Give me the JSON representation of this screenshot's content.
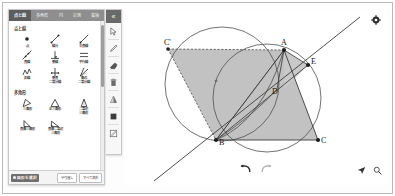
{
  "app": {
    "title": "幾何作図ツール"
  },
  "tool_panel": {
    "tabs": [
      {
        "label": "点と線",
        "active": true
      },
      {
        "label": "多角形",
        "active": false
      },
      {
        "label": "円",
        "active": false
      },
      {
        "label": "計測",
        "active": false
      },
      {
        "label": "変換",
        "active": false
      }
    ],
    "groups": [
      {
        "title": "点と線",
        "tools": [
          {
            "label": "点",
            "icon": "point-icon"
          },
          {
            "label": "線分",
            "icon": "segment-icon"
          },
          {
            "label": "半直線",
            "icon": "ray-icon"
          },
          {
            "label": "直線",
            "icon": "line-icon"
          },
          {
            "label": "垂線",
            "icon": "perpendicular-icon"
          },
          {
            "label": "平行線",
            "icon": "parallel-icon"
          },
          {
            "label": "折線",
            "icon": "polyline-icon"
          },
          {
            "label": "垂直\n二等分線",
            "icon": "perp-bisector-icon"
          },
          {
            "label": "角の\n二等分線",
            "icon": "angle-bisector-icon"
          }
        ]
      },
      {
        "title": "多角形",
        "tools": [
          {
            "label": "三角形",
            "icon": "triangle-icon"
          },
          {
            "label": "正三角形",
            "icon": "equilateral-triangle-icon"
          },
          {
            "label": "二等辺\n三角形",
            "icon": "isosceles-triangle-icon"
          },
          {
            "label": "直角三角形",
            "icon": "right-triangle-icon"
          },
          {
            "label": "直角二等辺\n三角形",
            "icon": "right-isosceles-icon"
          }
        ]
      }
    ],
    "footer": {
      "status_chip": "図形を選択",
      "buttons": [
        {
          "label": "やり直し"
        },
        {
          "label": "すべて消去"
        }
      ]
    }
  },
  "vertical_toolbar": {
    "collapse_label": "«",
    "items": [
      {
        "name": "select-tool",
        "icon": "cursor-icon"
      },
      {
        "name": "pen-tool",
        "icon": "pen-icon"
      },
      {
        "name": "eraser-tool",
        "icon": "eraser-icon"
      },
      {
        "name": "delete-tool",
        "icon": "trash-icon"
      },
      {
        "name": "color-tool",
        "icon": "color-triangle-icon"
      },
      {
        "name": "fill-tool",
        "icon": "fill-square-icon"
      },
      {
        "name": "note-tool",
        "icon": "edit-note-icon"
      }
    ]
  },
  "canvas": {
    "gear_label": "⚙",
    "undo_label": "元に戻す",
    "redo_label": "やり直す",
    "pan_label": "移動",
    "zoom_label": "拡大",
    "points": [
      {
        "label": "A",
        "x": 160,
        "y": 40
      },
      {
        "label": "B",
        "x": 91,
        "y": 130
      },
      {
        "label": "C",
        "x": 193,
        "y": 130
      },
      {
        "label": "D",
        "x": 153,
        "y": 79
      },
      {
        "label": "E",
        "x": 183,
        "y": 55
      },
      {
        "label": "C'",
        "x": 42,
        "y": 39
      }
    ],
    "colors": {
      "fill": "#bdbdbd",
      "stroke": "#4d4d4d",
      "circle": "#555555",
      "point": "#222222"
    }
  }
}
